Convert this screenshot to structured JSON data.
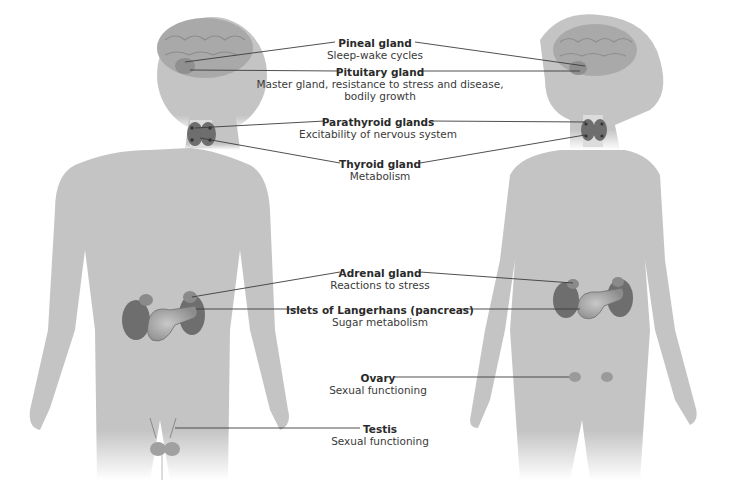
{
  "figure": {
    "colors": {
      "silhouette": "#c4c4c4",
      "organ_dark": "#6e6e6e",
      "organ_mid": "#8a8a8a",
      "organ_light": "#b0b0b0",
      "brain": "#a9a9a9",
      "leader_line": "#3c3c3c",
      "text": "#3a3a3a"
    },
    "figures": [
      "male",
      "female"
    ],
    "glands": [
      {
        "name": "Pineal gland",
        "function": "Sleep-wake cycles"
      },
      {
        "name": "Pituitary gland",
        "function": "Master gland, resistance to stress and disease,",
        "function_line2": "bodily growth"
      },
      {
        "name": "Parathyroid glands",
        "function": "Excitability of nervous system"
      },
      {
        "name": "Thyroid gland",
        "function": "Metabolism"
      },
      {
        "name": "Adrenal gland",
        "function": "Reactions to stress"
      },
      {
        "name": "Islets of Langerhans (pancreas)",
        "function": "Sugar metabolism"
      },
      {
        "name": "Ovary",
        "function": "Sexual functioning"
      },
      {
        "name": "Testis",
        "function": "Sexual functioning"
      }
    ]
  }
}
